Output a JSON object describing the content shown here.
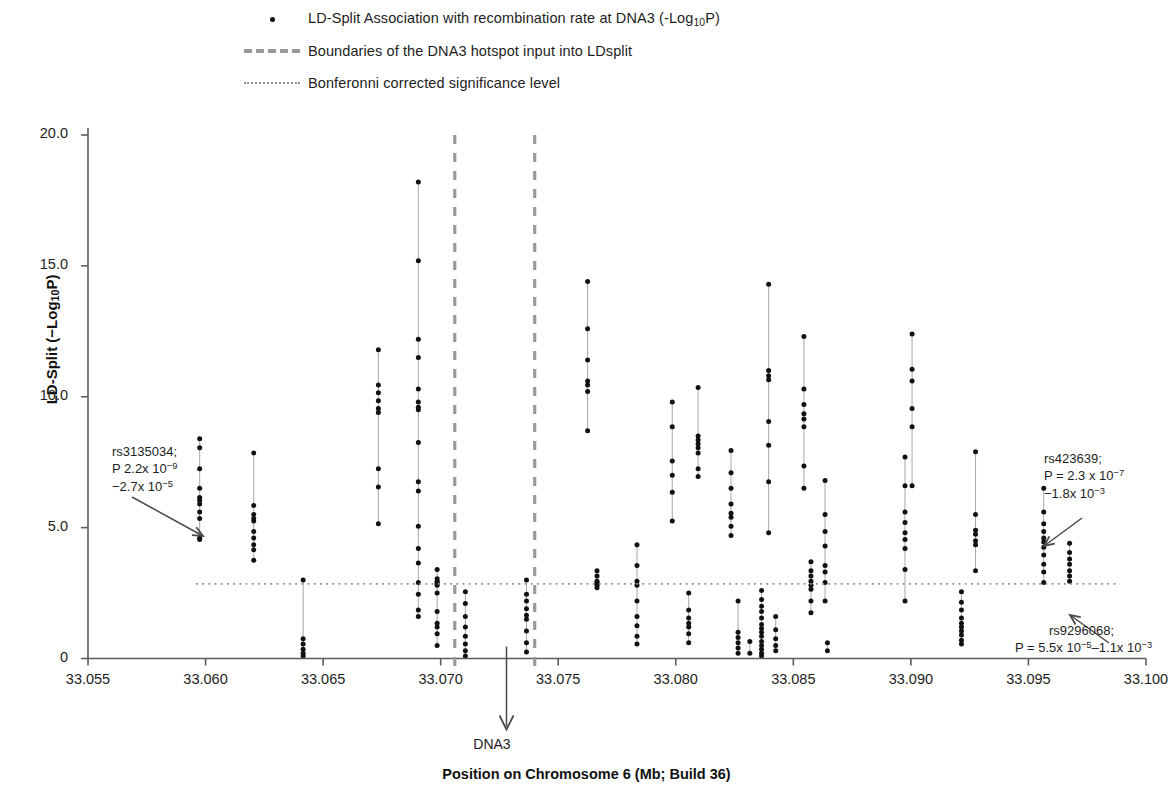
{
  "legend": {
    "items": [
      {
        "key": "dot",
        "label_prefix": "LD-Split Association with recombination rate at DNA3 (-Log",
        "label_sub": "10",
        "label_suffix": "P)"
      },
      {
        "key": "dashed",
        "label": "Boundaries of the DNA3 hotspot input into LDsplit"
      },
      {
        "key": "dotted",
        "label": "Bonferonni corrected significance level"
      }
    ],
    "dot_label_full": "LD-Split Association with recombination rate at DNA3 (-Log10P)",
    "dashed_label": "Boundaries of the DNA3 hotspot input into LDsplit",
    "dotted_label": "Bonferonni corrected significance level"
  },
  "axes": {
    "y_label_prefix": "LD-Split (−Log",
    "y_label_sub": "10",
    "y_label_suffix": "P)",
    "y_label_full": "LD-Split (−Log10P)",
    "x_label": "Position on Chromosome  6 (Mb; Build 36)",
    "x_ticks": [
      "33.055",
      "33.060",
      "33.065",
      "33.070",
      "33.075",
      "33.080",
      "33.085",
      "33.090",
      "33.095",
      "33.100"
    ],
    "y_ticks": [
      "20.0",
      "15.0",
      "10.0",
      "5.0",
      "0"
    ]
  },
  "marker_label": "DNA3",
  "annotations": [
    {
      "name": "rs3135034",
      "line1": "rs3135034;",
      "line2_prefix": "P 2.2x 10",
      "line2_sup": "−9",
      "line3_prefix": "−2.7x 10",
      "line3_sup": "−5",
      "full": "rs3135034; P 2.2x 10-9 −2.7x 10-5"
    },
    {
      "name": "rs423639",
      "line1": "rs423639;",
      "line2_prefix": "P = 2.3 x 10",
      "line2_sup": "−7",
      "line3_prefix": "−1.8x 10",
      "line3_sup": "−3",
      "full": "rs423639; P = 2.3 x 10-7 −1.8x 10-3"
    },
    {
      "name": "rs9296068",
      "line1": "rs9296068;",
      "line2_prefix": "P = 5.5x 10",
      "line2_sup": "−5",
      "line2_mid": "–1.1x 10",
      "line2_sup2": "−3",
      "full": "rs9296068; P = 5.5x 10-5–1.1x 10-3"
    }
  ],
  "colors": {
    "point": "#111111",
    "stem": "#9d9d9d",
    "boundary_dash": "#9a9a9a",
    "significance_dotted": "#8d8d8d",
    "axis": "#5c5c5c",
    "text": "#1d1d1d"
  },
  "chart_data": {
    "type": "scatter",
    "title": "",
    "xlabel": "Position on Chromosome  6 (Mb; Build 36)",
    "ylabel": "LD-Split (−Log10P)",
    "xlim": [
      33.055,
      33.1
    ],
    "ylim": [
      0,
      20.8
    ],
    "grid": false,
    "legend_position": "top",
    "significance_line_y": 2.85,
    "hotspot_boundaries_x": [
      33.0706,
      33.074
    ],
    "dna3_arrow_x": 33.0728,
    "columns": [
      {
        "x": 33.05975,
        "values": [
          8.4,
          8.05,
          7.25,
          6.5,
          6.15,
          6.05,
          5.9,
          5.6,
          5.35,
          4.6,
          4.55
        ]
      },
      {
        "x": 33.06205,
        "values": [
          7.85,
          5.85,
          5.5,
          5.35,
          5.25,
          4.85,
          4.6,
          4.35,
          4.15,
          3.75
        ]
      },
      {
        "x": 33.06415,
        "values": [
          3.0,
          0.75,
          0.55,
          0.35,
          0.2,
          0.1
        ]
      },
      {
        "x": 33.06735,
        "values": [
          11.8,
          10.45,
          10.15,
          9.85,
          9.55,
          9.4,
          7.25,
          6.55,
          5.15
        ]
      },
      {
        "x": 33.06905,
        "values": [
          18.2,
          15.2,
          12.2,
          11.5,
          10.3,
          9.8,
          9.6,
          9.5,
          8.25,
          6.75,
          6.4,
          5.05,
          4.2,
          3.65,
          2.9,
          2.45,
          1.85,
          1.6
        ]
      },
      {
        "x": 33.06985,
        "values": [
          3.4,
          3.05,
          2.95,
          2.9,
          2.85,
          2.8,
          2.5,
          1.8,
          1.35,
          1.2,
          0.95,
          0.5
        ]
      },
      {
        "x": 33.07105,
        "values": [
          2.55,
          2.1,
          1.6,
          1.2,
          0.85,
          0.55,
          0.3,
          0.1
        ]
      },
      {
        "x": 33.07365,
        "values": [
          3.0,
          2.45,
          2.2,
          1.9,
          1.65,
          1.5,
          1.05,
          0.6,
          0.25
        ]
      },
      {
        "x": 33.07625,
        "values": [
          14.4,
          12.6,
          11.4,
          10.6,
          10.45,
          10.2,
          8.7
        ]
      },
      {
        "x": 33.07665,
        "values": [
          3.35,
          3.15,
          2.95,
          2.9,
          2.85,
          2.8,
          2.7
        ]
      },
      {
        "x": 33.07835,
        "values": [
          4.35,
          3.55,
          2.95,
          2.8,
          2.2,
          1.6,
          1.25,
          0.85,
          0.55
        ]
      },
      {
        "x": 33.07985,
        "values": [
          9.8,
          8.85,
          7.55,
          7.0,
          6.35,
          5.25
        ]
      },
      {
        "x": 33.08055,
        "values": [
          2.5,
          1.85,
          1.55,
          1.35,
          1.2,
          0.95,
          0.6
        ]
      },
      {
        "x": 33.08095,
        "values": [
          10.35,
          8.5,
          8.35,
          8.2,
          8.05,
          7.85,
          7.25,
          6.95
        ]
      },
      {
        "x": 33.08235,
        "values": [
          7.95,
          7.1,
          6.5,
          5.9,
          5.55,
          5.4,
          5.05,
          4.7
        ]
      },
      {
        "x": 33.08265,
        "values": [
          2.2,
          1.0,
          0.8,
          0.6,
          0.4,
          0.2
        ]
      },
      {
        "x": 33.08315,
        "values": [
          0.65,
          0.2
        ]
      },
      {
        "x": 33.08365,
        "values": [
          2.6,
          2.25,
          2.0,
          1.8,
          1.55,
          1.3,
          1.15,
          1.0,
          0.85,
          0.65,
          0.5,
          0.35,
          0.2,
          0.1
        ]
      },
      {
        "x": 33.08395,
        "values": [
          14.3,
          11.0,
          10.8,
          10.65,
          9.05,
          8.15,
          6.75,
          4.8
        ]
      },
      {
        "x": 33.08425,
        "values": [
          1.6,
          1.1,
          0.75,
          0.5,
          0.3
        ]
      },
      {
        "x": 33.08545,
        "values": [
          12.3,
          10.3,
          9.7,
          9.35,
          9.15,
          8.85,
          7.35,
          6.5
        ]
      },
      {
        "x": 33.08575,
        "values": [
          3.7,
          3.35,
          3.15,
          2.95,
          2.8,
          2.65,
          2.2,
          1.75
        ]
      },
      {
        "x": 33.08635,
        "values": [
          6.8,
          5.5,
          4.85,
          4.3,
          3.55,
          3.3,
          2.9,
          2.2
        ]
      },
      {
        "x": 33.08645,
        "values": [
          0.6,
          0.3
        ]
      },
      {
        "x": 33.08975,
        "values": [
          7.7,
          6.6,
          5.6,
          5.2,
          4.8,
          4.55,
          4.2,
          3.4,
          2.2
        ]
      },
      {
        "x": 33.09005,
        "values": [
          12.4,
          11.05,
          10.6,
          9.55,
          8.85,
          6.6
        ]
      },
      {
        "x": 33.09215,
        "values": [
          2.55,
          2.15,
          1.85,
          1.55,
          1.35,
          1.2,
          1.05,
          0.9,
          0.7,
          0.55
        ]
      },
      {
        "x": 33.09275,
        "values": [
          7.9,
          5.5,
          4.9,
          4.75,
          4.5,
          4.35,
          3.35
        ]
      },
      {
        "x": 33.09565,
        "values": [
          6.5,
          5.6,
          5.15,
          4.85,
          4.6,
          4.45,
          4.25,
          3.95,
          3.6,
          3.3,
          2.9
        ]
      },
      {
        "x": 33.09675,
        "values": [
          4.4,
          4.05,
          3.8,
          3.6,
          3.35,
          3.15,
          2.95
        ]
      }
    ]
  }
}
